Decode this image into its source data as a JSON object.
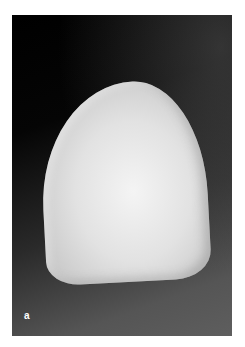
{
  "figure": {
    "panel_label": "a",
    "colors": {
      "background": "#ffffff",
      "photo_dark": "#000000",
      "photo_light": "#5e5e5e",
      "tooth": "#e2e2e2",
      "label": "#ffffff"
    }
  }
}
